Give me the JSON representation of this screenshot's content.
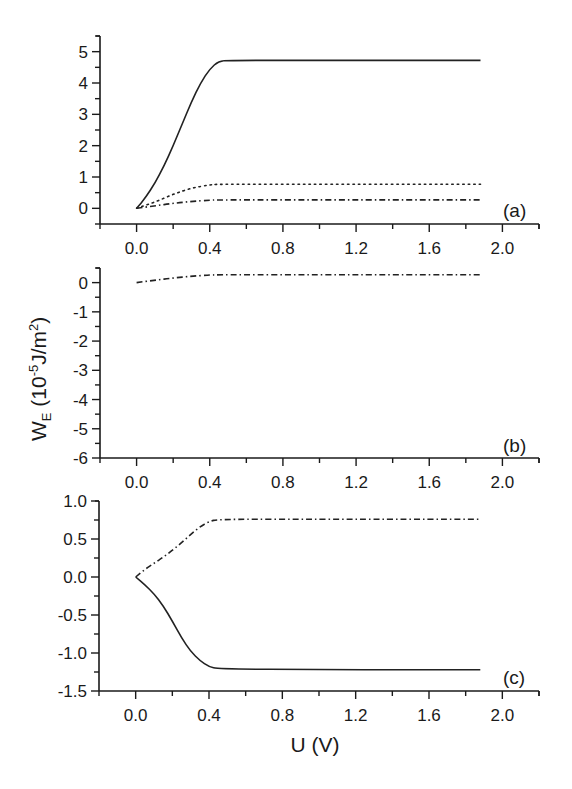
{
  "chart_data": [
    {
      "type": "line",
      "panel": "(a)",
      "xlabel": "",
      "ylabel": "",
      "xlim": [
        -0.2,
        2.2
      ],
      "ylim": [
        -0.5,
        5.5
      ],
      "xticks": [
        "0.0",
        "0.4",
        "0.8",
        "1.2",
        "1.6",
        "2.0"
      ],
      "yticks": [
        "0",
        "1",
        "2",
        "3",
        "4",
        "5"
      ],
      "grid": false,
      "series": [
        {
          "name": "solid",
          "style": "solid",
          "x": [
            0.0,
            0.05,
            0.1,
            0.15,
            0.2,
            0.25,
            0.3,
            0.35,
            0.4,
            0.45,
            0.5,
            1.0,
            1.5,
            1.88
          ],
          "y": [
            0.0,
            0.35,
            0.8,
            1.35,
            2.0,
            2.7,
            3.4,
            4.0,
            4.45,
            4.7,
            4.72,
            4.72,
            4.72,
            4.72
          ]
        },
        {
          "name": "dotted",
          "style": "dotted",
          "x": [
            0.0,
            0.1,
            0.2,
            0.3,
            0.4,
            0.45,
            1.0,
            1.5,
            1.88
          ],
          "y": [
            0.0,
            0.2,
            0.45,
            0.65,
            0.75,
            0.77,
            0.77,
            0.77,
            0.77
          ]
        },
        {
          "name": "dash-dot",
          "style": "dashdot",
          "x": [
            0.0,
            0.1,
            0.2,
            0.3,
            0.4,
            0.45,
            1.0,
            1.5,
            1.88
          ],
          "y": [
            0.0,
            0.08,
            0.16,
            0.22,
            0.26,
            0.27,
            0.27,
            0.27,
            0.27
          ]
        }
      ]
    },
    {
      "type": "line",
      "panel": "(b)",
      "xlabel": "",
      "ylabel": "W_E (10^-5 J/m^2)",
      "xlim": [
        -0.2,
        2.2
      ],
      "ylim": [
        -6,
        0.5
      ],
      "xticks": [
        "0.0",
        "0.4",
        "0.8",
        "1.2",
        "1.6",
        "2.0"
      ],
      "yticks": [
        "0",
        "-1",
        "-2",
        "-3",
        "-4",
        "-5",
        "-6"
      ],
      "grid": false,
      "series": [
        {
          "name": "dash-dot",
          "style": "dashdot",
          "x": [
            0.0,
            0.1,
            0.2,
            0.3,
            0.4,
            0.45,
            1.0,
            1.5,
            1.88
          ],
          "y": [
            0.0,
            0.08,
            0.16,
            0.22,
            0.26,
            0.27,
            0.27,
            0.27,
            0.27
          ]
        }
      ]
    },
    {
      "type": "line",
      "panel": "(c)",
      "xlabel": "U (V)",
      "ylabel": "",
      "xlim": [
        -0.2,
        2.2
      ],
      "ylim": [
        -1.5,
        1.0
      ],
      "xticks": [
        "0.0",
        "0.4",
        "0.8",
        "1.2",
        "1.6",
        "2.0"
      ],
      "yticks": [
        "1.0",
        "0.5",
        "0.0",
        "-0.5",
        "-1.0",
        "-1.5"
      ],
      "grid": false,
      "series": [
        {
          "name": "dash-dot",
          "style": "dashdot",
          "x": [
            0.0,
            0.05,
            0.1,
            0.15,
            0.2,
            0.25,
            0.3,
            0.35,
            0.4,
            0.45,
            1.0,
            1.5,
            1.88
          ],
          "y": [
            0.0,
            0.1,
            0.18,
            0.26,
            0.35,
            0.45,
            0.56,
            0.66,
            0.73,
            0.76,
            0.76,
            0.76,
            0.76
          ]
        },
        {
          "name": "solid",
          "style": "solid",
          "x": [
            0.0,
            0.05,
            0.1,
            0.15,
            0.2,
            0.25,
            0.3,
            0.35,
            0.4,
            0.45,
            1.0,
            1.5,
            1.88
          ],
          "y": [
            0.0,
            -0.1,
            -0.22,
            -0.38,
            -0.58,
            -0.8,
            -0.98,
            -1.1,
            -1.18,
            -1.21,
            -1.22,
            -1.22,
            -1.22
          ]
        }
      ]
    }
  ],
  "labels": {
    "panel_a": "(a)",
    "panel_b": "(b)",
    "panel_c": "(c)",
    "ylabel_main": "W",
    "ylabel_sub": "E",
    "ylabel_unit_open": " (10",
    "ylabel_exp": "-5",
    "ylabel_unit_mid": "J/m",
    "ylabel_exp2": "2",
    "ylabel_close": ")",
    "xlabel": "U (V)"
  }
}
